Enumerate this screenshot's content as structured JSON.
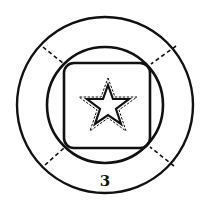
{
  "diagram": {
    "label": "3",
    "colors": {
      "stroke": "#111111",
      "background": "#ffffff"
    },
    "shapes": {
      "outer_circle": {
        "cx": 105,
        "cy": 105,
        "r": 88
      },
      "inner_circle": {
        "cx": 105,
        "cy": 105,
        "r": 58
      },
      "rounded_square": {
        "x": 64,
        "y": 63,
        "w": 86,
        "h": 85,
        "rx": 10
      },
      "star": {
        "cx": 108,
        "cy": 106
      },
      "dashed_connectors": 4
    }
  }
}
